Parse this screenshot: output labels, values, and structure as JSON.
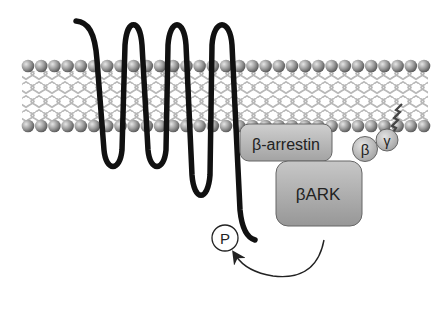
{
  "diagram": {
    "type": "GPCR desensitization schematic",
    "membrane": {
      "head_color": "#8f8f8f",
      "tail_color": "#b9b9b9"
    },
    "receptor": {
      "name": "7-transmembrane receptor",
      "color": "#111111"
    },
    "proteins": {
      "beta_arrestin": {
        "label": "β-arrestin"
      },
      "bark": {
        "label": "βARK"
      },
      "g_beta": {
        "label": "β"
      },
      "g_gamma": {
        "label": "γ"
      },
      "phosphate": {
        "label": "P"
      }
    },
    "arrow": {
      "from": "βARK",
      "to": "P",
      "meaning": "phosphorylation"
    }
  }
}
